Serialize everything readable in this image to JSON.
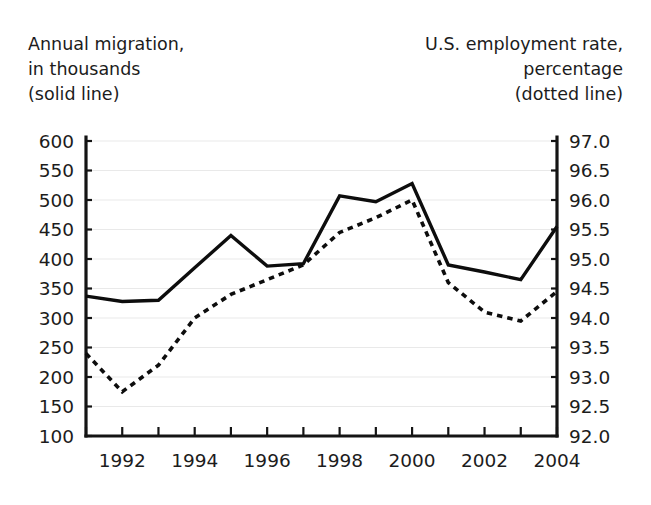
{
  "captions": {
    "left": [
      "Annual migration,",
      "in thousands",
      "(solid line)"
    ],
    "right": [
      "U.S. employment rate,",
      "percentage",
      "(dotted line)"
    ]
  },
  "chart_data": {
    "type": "line",
    "title": "",
    "xlabel": "",
    "x": [
      1991,
      1992,
      1993,
      1994,
      1995,
      1996,
      1997,
      1998,
      1999,
      2000,
      2001,
      2002,
      2003,
      2004
    ],
    "xlim": [
      1991,
      2004
    ],
    "xtick_labels": [
      "1992",
      "1994",
      "1996",
      "1998",
      "2000",
      "2002",
      "2004"
    ],
    "xtick_values": [
      1992,
      1994,
      1996,
      1998,
      2000,
      2002,
      2004
    ],
    "xtick_minor_values": [
      1991,
      1993,
      1995,
      1997,
      1999,
      2001,
      2003
    ],
    "grid": true,
    "legend_position": "none",
    "series": [
      {
        "name": "Annual migration, in thousands (solid line)",
        "style": "solid",
        "axis": "left",
        "ylabel": "Annual migration, in thousands",
        "ylim": [
          100,
          600
        ],
        "ytick_labels": [
          "600",
          "550",
          "500",
          "450",
          "400",
          "350",
          "300",
          "250",
          "200",
          "150",
          "100"
        ],
        "ytick_values": [
          600,
          550,
          500,
          450,
          400,
          350,
          300,
          250,
          200,
          150,
          100
        ],
        "values": [
          337,
          328,
          330,
          385,
          440,
          388,
          392,
          507,
          497,
          528,
          390,
          378,
          365,
          455
        ]
      },
      {
        "name": "U.S. employment rate, percentage (dotted line)",
        "style": "dotted",
        "axis": "right",
        "ylabel": "U.S. employment rate, percentage",
        "ylim": [
          92.0,
          97.0
        ],
        "ytick_labels": [
          "97.0",
          "96.5",
          "96.0",
          "95.5",
          "95.0",
          "94.5",
          "94.0",
          "93.5",
          "93.0",
          "92.5",
          "92.0"
        ],
        "ytick_values": [
          97.0,
          96.5,
          96.0,
          95.5,
          95.0,
          94.5,
          94.0,
          93.5,
          93.0,
          92.5,
          92.0
        ],
        "values": [
          93.4,
          92.75,
          93.2,
          94.0,
          94.4,
          94.65,
          94.9,
          95.45,
          95.7,
          96.0,
          94.6,
          94.1,
          93.95,
          94.45
        ]
      }
    ]
  },
  "colors": {
    "line": "#0d0d0d",
    "axis": "#141414",
    "grid": "#e9e9e9",
    "text": "#1c1c1c",
    "background": "#ffffff"
  }
}
